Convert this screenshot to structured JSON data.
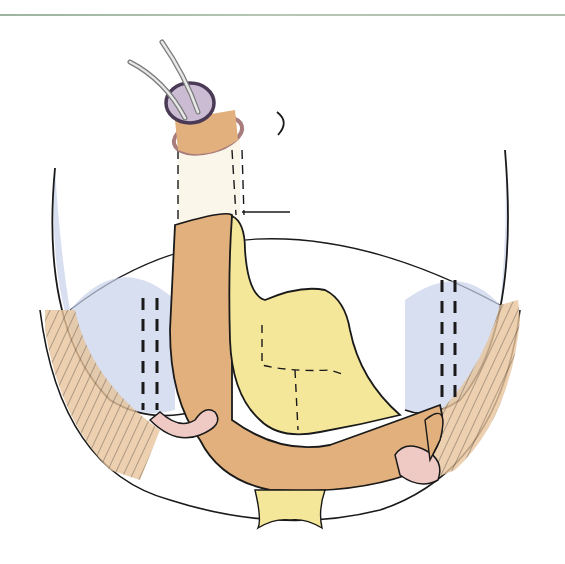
{
  "figure": {
    "type": "surgical-illustration",
    "style": "hand-drawn colored pencil",
    "elements": [
      "esophagus-with-drainage-tubes",
      "purse-string-ring",
      "gastric-tube-orange",
      "stomach-remnant-yellow",
      "left-diaphragm-blue",
      "right-diaphragm-blue",
      "dashed-suture-lines",
      "jejunal-loops-pink"
    ],
    "colors": {
      "stomach_yellow": "#f4e79a",
      "bowel_orange": "#e2b07c",
      "diaphragm_blue": "#9fb0d6",
      "ring_purple": "#7c6a86",
      "loop_pink": "#efc9c4",
      "ink": "#1a1a1a",
      "rule": "#a9bca9"
    }
  }
}
